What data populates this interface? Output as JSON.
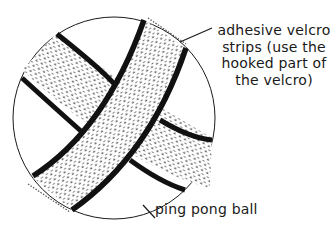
{
  "figure": {
    "colors": {
      "ink": "#1a1a1a",
      "background": "#ffffff"
    }
  },
  "labels": {
    "velcro_strips": "adhesive velcro\nstrips (use the\nhooked part of\nthe velcro)",
    "ball": "ping pong ball"
  }
}
